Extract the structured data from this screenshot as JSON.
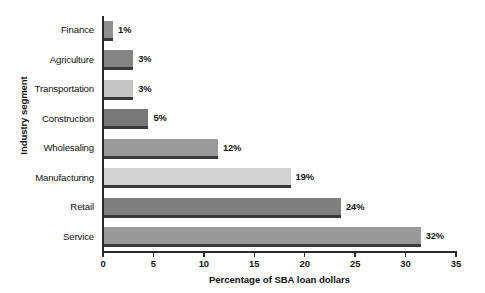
{
  "chart_data": {
    "type": "bar",
    "orientation": "horizontal",
    "title": "",
    "xlabel": "Percentage of SBA loan dollars",
    "ylabel": "Industry segment",
    "xlim": [
      0,
      35
    ],
    "xticks": [
      0,
      5,
      10,
      15,
      20,
      25,
      30,
      35
    ],
    "grid": false,
    "legend": false,
    "categories": [
      "Finance",
      "Agriculture",
      "Transportation",
      "Construction",
      "Wholesaling",
      "Manufacturing",
      "Retail",
      "Service"
    ],
    "values": [
      1,
      3,
      3,
      4.5,
      11.4,
      18.6,
      23.6,
      31.5
    ],
    "data_labels": [
      "1%",
      "3%",
      "3%",
      "5%",
      "12%",
      "19%",
      "24%",
      "32%"
    ],
    "bars": [
      {
        "category": "Finance",
        "value": 1,
        "label": "1%",
        "color": "#8f8f8f"
      },
      {
        "category": "Agriculture",
        "value": 3,
        "label": "3%",
        "color": "#848484"
      },
      {
        "category": "Transportation",
        "value": 3,
        "label": "3%",
        "color": "#c5c5c5"
      },
      {
        "category": "Construction",
        "value": 4.5,
        "label": "5%",
        "color": "#787878"
      },
      {
        "category": "Wholesaling",
        "value": 11.4,
        "label": "12%",
        "color": "#9a9a9a"
      },
      {
        "category": "Manufacturing",
        "value": 18.6,
        "label": "19%",
        "color": "#d2d2d2"
      },
      {
        "category": "Retail",
        "value": 23.6,
        "label": "24%",
        "color": "#7f7f7f"
      },
      {
        "category": "Service",
        "value": 31.5,
        "label": "32%",
        "color": "#999999"
      }
    ]
  },
  "colors": {
    "background": "#ffffff",
    "axis": "#2b2b2b",
    "text": "#121212",
    "bar_shadow": "#3a3a3a"
  }
}
